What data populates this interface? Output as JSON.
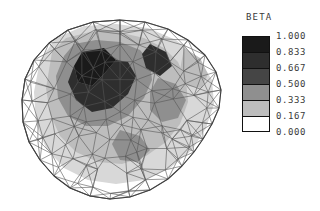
{
  "figure": {
    "type": "fem-contour-plot",
    "background_color": "#ffffff",
    "mesh_line_color": "#555555"
  },
  "legend": {
    "title": "BETA",
    "labels": [
      "1.000",
      "0.833",
      "0.667",
      "0.500",
      "0.333",
      "0.167",
      "0.000"
    ],
    "swatch_colors": [
      "#1a1a1a",
      "#2e2e2e",
      "#454545",
      "#8f8f8f",
      "#bdbdbd",
      "#ffffff"
    ],
    "swatch_count": 6
  },
  "chart_data": {
    "type": "heatmap",
    "title": "BETA",
    "xlabel": "",
    "ylabel": "",
    "legend_position": "right",
    "grid": false,
    "colorbar": {
      "variable": "BETA",
      "min": 0.0,
      "max": 1.0,
      "step": 0.1667,
      "levels": [
        0.0,
        0.167,
        0.333,
        0.5,
        0.667,
        0.833,
        1.0
      ],
      "band_labels": [
        "0.000-0.167",
        "0.167-0.333",
        "0.333-0.500",
        "0.500-0.667",
        "0.667-0.833",
        "0.833-1.000"
      ],
      "band_colors": [
        "#ffffff",
        "#bdbdbd",
        "#8f8f8f",
        "#454545",
        "#2e2e2e",
        "#1a1a1a"
      ]
    },
    "mesh": {
      "element_type": "triangle",
      "approx_node_count": 120,
      "approx_element_count": 200,
      "domain_shape": "irregular-blob",
      "outline_points": "120,20 145,22 168,29 188,40 205,55 216,72 221,90 219,108 212,124 203,139 194,152 182,166 168,179 150,190 130,197 110,199 90,196 70,188 54,176 40,160 29,142 23,122 22,100 25,79 34,60 49,43 68,30 93,22",
      "bands": [
        {
          "level": "0.833-1.000",
          "color": "#1a1a1a",
          "polygons": [
            "82,52 104,48 116,60 104,74 92,86 78,82 74,66"
          ]
        },
        {
          "level": "0.667-0.833",
          "color": "#2e2e2e",
          "polygons": [
            "74,66 78,82 92,86 104,74 116,60 128,62 136,76 128,94 112,108 92,112 76,100 68,82",
            "150,44 166,52 172,66 160,76 146,68 142,54"
          ]
        },
        {
          "level": "0.500-0.667",
          "color": "#8f8f8f",
          "polygons": [
            "64,56 74,44 96,40 120,42 140,50 150,62 152,80 144,98 128,116 108,126 86,126 68,116 58,98 56,76",
            "158,78 176,84 186,100 178,118 162,122 150,110 150,92",
            "120,130 140,136 150,150 138,162 120,160 112,144"
          ]
        },
        {
          "level": "0.333-0.500",
          "color": "#bdbdbd",
          "polygons": [
            "52,52 66,38 90,32 118,32 144,38 164,48 178,62 186,80 188,102 180,124 166,142 146,156 122,164 98,162 76,152 60,136 50,114 46,88",
            "184,48 200,58 208,74 202,88 188,86 180,70"
          ]
        },
        {
          "level": "0.167-0.333",
          "color": "#d8d8d8",
          "polygons": [
            "40,60 56,38 84,26 116,24 148,28 176,40 198,58 212,80 214,104 206,128 192,150 170,168 144,180 116,184 88,180 64,168 46,148 36,124 34,92"
          ]
        }
      ]
    }
  }
}
